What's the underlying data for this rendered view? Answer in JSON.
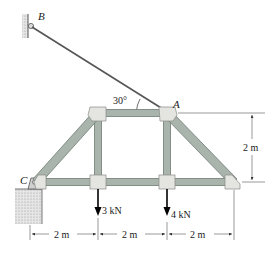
{
  "diagram": {
    "type": "truss",
    "points": {
      "B": {
        "label": "B",
        "x": 30,
        "y": 25
      },
      "A": {
        "label": "A",
        "x": 167,
        "y": 113
      },
      "C": {
        "label": "C",
        "x": 36,
        "y": 182
      }
    },
    "cable_angle_label": "30°",
    "loads": [
      {
        "label": "3 kN",
        "x": 98
      },
      {
        "label": "4 kN",
        "x": 167
      }
    ],
    "dimensions": {
      "height": "2 m",
      "spans": [
        "2 m",
        "2 m",
        "2 m"
      ]
    },
    "colors": {
      "member": "#a9b4ad",
      "member_edge": "#6f7c74",
      "gusset": "#e4e4e0",
      "cable": "#555555",
      "ground": "#c8c8c8",
      "text": "#1a1a1a"
    }
  }
}
